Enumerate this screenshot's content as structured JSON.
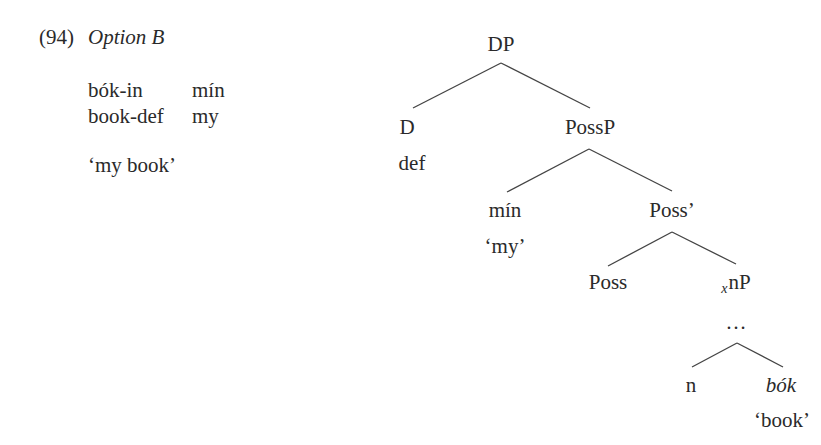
{
  "example": {
    "number": "(94)",
    "title": "Option B",
    "gloss": {
      "words": [
        "bók-in",
        "mín"
      ],
      "glosses": [
        "book-def",
        "my"
      ]
    },
    "translation": "‘my book’"
  },
  "tree": {
    "root": "DP",
    "d": {
      "label": "D",
      "word": "def"
    },
    "possp": "PossP",
    "spec": {
      "label": "mín",
      "gloss": "‘my’"
    },
    "poss_bar": "Poss’",
    "poss_head": "Poss",
    "xnp": {
      "subscript": "x",
      "label": "nP"
    },
    "ellipsis": "…",
    "n": "n",
    "root_word": {
      "label": "bók",
      "gloss": "‘book’"
    }
  }
}
